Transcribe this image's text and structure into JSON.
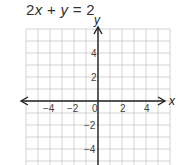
{
  "problem": {
    "equation_text": "2x + y = 2",
    "equation_parts": [
      "2",
      "x",
      " + ",
      "y",
      " = 2"
    ]
  },
  "graph": {
    "x_axis_label": "x",
    "y_axis_label": "y",
    "x_tick_labels": [
      "−4",
      "−2",
      "0",
      "2",
      "4"
    ],
    "y_tick_labels": [
      "4",
      "2",
      "−2",
      "−4"
    ],
    "x_range": [
      -6,
      6
    ],
    "y_range": [
      -5.5,
      6
    ],
    "grid_step": 1,
    "grid_color": "#c8c8c8",
    "axis_color": "#222222"
  }
}
